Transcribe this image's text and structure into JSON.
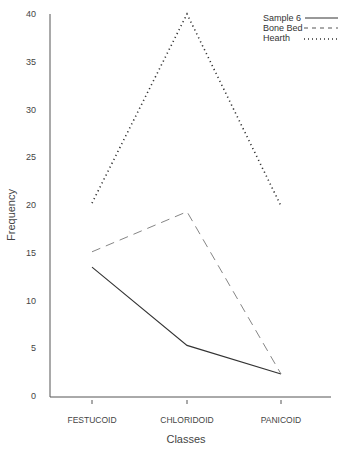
{
  "chart_data": {
    "type": "line",
    "title": "",
    "xlabel": "Classes",
    "ylabel": "Frequency",
    "categories": [
      "FESTUCOID",
      "CHLORIDOID",
      "PANICOID"
    ],
    "ylim": [
      0,
      40
    ],
    "yticks": [
      0,
      5,
      10,
      15,
      20,
      25,
      30,
      35,
      40
    ],
    "grid": false,
    "legend_position": "top-right",
    "series": [
      {
        "name": "Sample 6",
        "style": "solid",
        "values": [
          13.5,
          5.3,
          2.3
        ]
      },
      {
        "name": "Bone Bed",
        "style": "dashed",
        "values": [
          15.1,
          19.3,
          2.3
        ]
      },
      {
        "name": "Hearth",
        "style": "dotted",
        "values": [
          20.2,
          40.0,
          19.9
        ]
      }
    ]
  },
  "legend": {
    "items": [
      {
        "label": "Sample 6"
      },
      {
        "label": "Bone Bed"
      },
      {
        "label": "Hearth"
      }
    ]
  }
}
